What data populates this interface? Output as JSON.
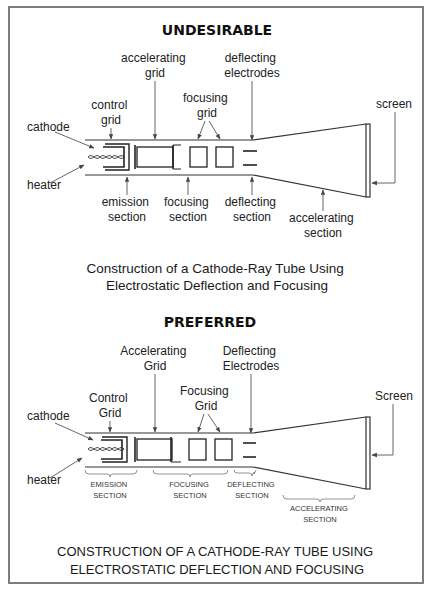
{
  "diagrams": [
    {
      "heading": "UNDESIRABLE",
      "labels": {
        "accelerating_grid": [
          "accelerating",
          "grid"
        ],
        "deflecting_electrodes": [
          "deflecting",
          "electrodes"
        ],
        "focusing_grid": [
          "focusing",
          "grid"
        ],
        "control_grid": [
          "control",
          "grid"
        ],
        "cathode": "cathode",
        "heater": "heater",
        "screen": "screen",
        "emission_section": [
          "emission",
          "section"
        ],
        "focusing_section": [
          "focusing",
          "section"
        ],
        "deflecting_section": [
          "deflecting",
          "section"
        ],
        "accelerating_section": [
          "accelerating",
          "section"
        ]
      },
      "caption": [
        "Construction of a Cathode-Ray Tube Using",
        "Electrostatic Deflection and Focusing"
      ]
    },
    {
      "heading": "PREFERRED",
      "labels": {
        "accelerating_grid": [
          "Accelerating",
          "Grid"
        ],
        "deflecting_electrodes": [
          "Deflecting",
          "Electrodes"
        ],
        "focusing_grid": [
          "Focusing",
          "Grid"
        ],
        "control_grid": [
          "Control",
          "Grid"
        ],
        "cathode": "cathode",
        "heater": "heater",
        "screen": "Screen",
        "emission_section": [
          "EMISSION",
          "SECTION"
        ],
        "focusing_section": [
          "FOCUSING",
          "SECTION"
        ],
        "deflecting_section": [
          "DEFLECTING",
          "SECTION"
        ],
        "accelerating_section": [
          "ACCELERATING",
          "SECTION"
        ]
      },
      "caption": [
        "CONSTRUCTION OF A CATHODE-RAY TUBE USING",
        "ELECTROSTATIC DEFLECTION AND FOCUSING"
      ]
    }
  ],
  "colors": {
    "frame": "#7d7d7d",
    "lines": "#333333",
    "text": "#222222"
  }
}
